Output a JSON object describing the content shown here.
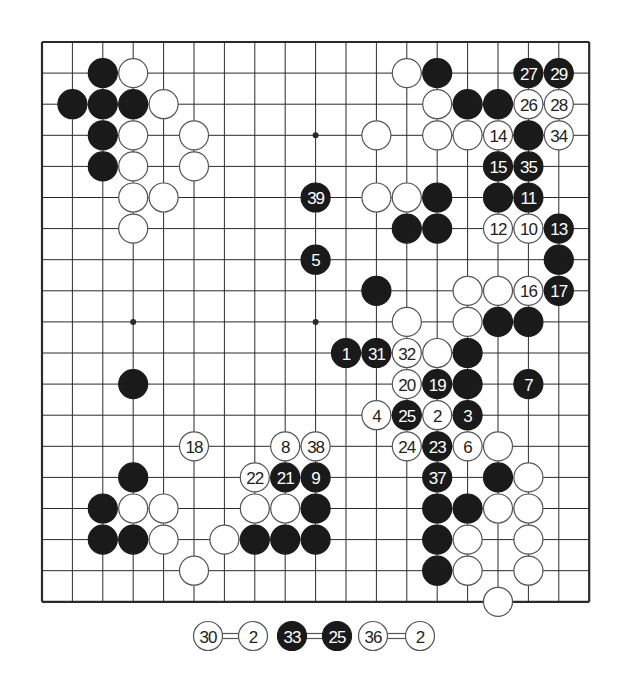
{
  "diagram": {
    "type": "go-board",
    "size": 19,
    "star_points": [
      [
        3,
        3
      ],
      [
        9,
        3
      ],
      [
        15,
        3
      ],
      [
        3,
        9
      ],
      [
        9,
        9
      ],
      [
        15,
        9
      ],
      [
        3,
        15
      ],
      [
        9,
        15
      ],
      [
        15,
        15
      ]
    ],
    "colors": {
      "black": "#1a1a1a",
      "white": "#ffffff",
      "line": "#2a2a2a",
      "stone_outline": "#555555"
    },
    "stones": [
      {
        "c": 2,
        "r": 1,
        "color": "black"
      },
      {
        "c": 1,
        "r": 2,
        "color": "black"
      },
      {
        "c": 2,
        "r": 2,
        "color": "black"
      },
      {
        "c": 3,
        "r": 2,
        "color": "black"
      },
      {
        "c": 2,
        "r": 3,
        "color": "black"
      },
      {
        "c": 2,
        "r": 4,
        "color": "black"
      },
      {
        "c": 13,
        "r": 1,
        "color": "black"
      },
      {
        "c": 16,
        "r": 1,
        "color": "black",
        "label": "27"
      },
      {
        "c": 17,
        "r": 1,
        "color": "black",
        "label": "29"
      },
      {
        "c": 14,
        "r": 2,
        "color": "black"
      },
      {
        "c": 15,
        "r": 2,
        "color": "black"
      },
      {
        "c": 16,
        "r": 3,
        "color": "black"
      },
      {
        "c": 15,
        "r": 4,
        "color": "black",
        "label": "15"
      },
      {
        "c": 16,
        "r": 4,
        "color": "black",
        "label": "35"
      },
      {
        "c": 9,
        "r": 5,
        "color": "black",
        "label": "39"
      },
      {
        "c": 13,
        "r": 5,
        "color": "black"
      },
      {
        "c": 15,
        "r": 5,
        "color": "black"
      },
      {
        "c": 16,
        "r": 5,
        "color": "black",
        "label": "11"
      },
      {
        "c": 12,
        "r": 6,
        "color": "black"
      },
      {
        "c": 13,
        "r": 6,
        "color": "black"
      },
      {
        "c": 17,
        "r": 6,
        "color": "black",
        "label": "13"
      },
      {
        "c": 9,
        "r": 7,
        "color": "black",
        "label": "5"
      },
      {
        "c": 17,
        "r": 7,
        "color": "black"
      },
      {
        "c": 11,
        "r": 8,
        "color": "black"
      },
      {
        "c": 17,
        "r": 8,
        "color": "black",
        "label": "17"
      },
      {
        "c": 15,
        "r": 9,
        "color": "black"
      },
      {
        "c": 16,
        "r": 9,
        "color": "black"
      },
      {
        "c": 10,
        "r": 10,
        "color": "black",
        "label": "1"
      },
      {
        "c": 11,
        "r": 10,
        "color": "black",
        "label": "31"
      },
      {
        "c": 14,
        "r": 10,
        "color": "black"
      },
      {
        "c": 3,
        "r": 11,
        "color": "black"
      },
      {
        "c": 13,
        "r": 11,
        "color": "black",
        "label": "19"
      },
      {
        "c": 14,
        "r": 11,
        "color": "black"
      },
      {
        "c": 16,
        "r": 11,
        "color": "black",
        "label": "7"
      },
      {
        "c": 12,
        "r": 12,
        "color": "black",
        "label": "25"
      },
      {
        "c": 14,
        "r": 12,
        "color": "black",
        "label": "3"
      },
      {
        "c": 13,
        "r": 13,
        "color": "black",
        "label": "23"
      },
      {
        "c": 3,
        "r": 14,
        "color": "black"
      },
      {
        "c": 8,
        "r": 14,
        "color": "black",
        "label": "21"
      },
      {
        "c": 9,
        "r": 14,
        "color": "black",
        "label": "9"
      },
      {
        "c": 13,
        "r": 14,
        "color": "black",
        "label": "37"
      },
      {
        "c": 15,
        "r": 14,
        "color": "black"
      },
      {
        "c": 2,
        "r": 15,
        "color": "black"
      },
      {
        "c": 9,
        "r": 15,
        "color": "black"
      },
      {
        "c": 13,
        "r": 15,
        "color": "black"
      },
      {
        "c": 14,
        "r": 15,
        "color": "black"
      },
      {
        "c": 2,
        "r": 16,
        "color": "black"
      },
      {
        "c": 3,
        "r": 16,
        "color": "black"
      },
      {
        "c": 7,
        "r": 16,
        "color": "black"
      },
      {
        "c": 8,
        "r": 16,
        "color": "black"
      },
      {
        "c": 9,
        "r": 16,
        "color": "black"
      },
      {
        "c": 13,
        "r": 16,
        "color": "black"
      },
      {
        "c": 13,
        "r": 17,
        "color": "black"
      },
      {
        "c": 3,
        "r": 1,
        "color": "white"
      },
      {
        "c": 12,
        "r": 1,
        "color": "white"
      },
      {
        "c": 4,
        "r": 2,
        "color": "white"
      },
      {
        "c": 13,
        "r": 2,
        "color": "white"
      },
      {
        "c": 16,
        "r": 2,
        "color": "white",
        "label": "26"
      },
      {
        "c": 17,
        "r": 2,
        "color": "white",
        "label": "28"
      },
      {
        "c": 3,
        "r": 3,
        "color": "white"
      },
      {
        "c": 5,
        "r": 3,
        "color": "white"
      },
      {
        "c": 11,
        "r": 3,
        "color": "white"
      },
      {
        "c": 13,
        "r": 3,
        "color": "white"
      },
      {
        "c": 14,
        "r": 3,
        "color": "white"
      },
      {
        "c": 15,
        "r": 3,
        "color": "white",
        "label": "14"
      },
      {
        "c": 17,
        "r": 3,
        "color": "white",
        "label": "34"
      },
      {
        "c": 3,
        "r": 4,
        "color": "white"
      },
      {
        "c": 5,
        "r": 4,
        "color": "white"
      },
      {
        "c": 3,
        "r": 5,
        "color": "white"
      },
      {
        "c": 4,
        "r": 5,
        "color": "white"
      },
      {
        "c": 11,
        "r": 5,
        "color": "white"
      },
      {
        "c": 12,
        "r": 5,
        "color": "white"
      },
      {
        "c": 3,
        "r": 6,
        "color": "white"
      },
      {
        "c": 15,
        "r": 6,
        "color": "white",
        "label": "12"
      },
      {
        "c": 16,
        "r": 6,
        "color": "white",
        "label": "10"
      },
      {
        "c": 14,
        "r": 8,
        "color": "white"
      },
      {
        "c": 15,
        "r": 8,
        "color": "white"
      },
      {
        "c": 16,
        "r": 8,
        "color": "white",
        "label": "16"
      },
      {
        "c": 12,
        "r": 9,
        "color": "white"
      },
      {
        "c": 14,
        "r": 9,
        "color": "white"
      },
      {
        "c": 12,
        "r": 10,
        "color": "white",
        "label": "32"
      },
      {
        "c": 13,
        "r": 10,
        "color": "white"
      },
      {
        "c": 12,
        "r": 11,
        "color": "white",
        "label": "20"
      },
      {
        "c": 11,
        "r": 12,
        "color": "white",
        "label": "4"
      },
      {
        "c": 13,
        "r": 12,
        "color": "white",
        "label": "2"
      },
      {
        "c": 5,
        "r": 13,
        "color": "white",
        "label": "18"
      },
      {
        "c": 8,
        "r": 13,
        "color": "white",
        "label": "8"
      },
      {
        "c": 9,
        "r": 13,
        "color": "white",
        "label": "38"
      },
      {
        "c": 12,
        "r": 13,
        "color": "white",
        "label": "24"
      },
      {
        "c": 14,
        "r": 13,
        "color": "white",
        "label": "6"
      },
      {
        "c": 15,
        "r": 13,
        "color": "white"
      },
      {
        "c": 7,
        "r": 14,
        "color": "white",
        "label": "22"
      },
      {
        "c": 16,
        "r": 14,
        "color": "white"
      },
      {
        "c": 3,
        "r": 15,
        "color": "white"
      },
      {
        "c": 4,
        "r": 15,
        "color": "white"
      },
      {
        "c": 7,
        "r": 15,
        "color": "white"
      },
      {
        "c": 8,
        "r": 15,
        "color": "white"
      },
      {
        "c": 15,
        "r": 15,
        "color": "white"
      },
      {
        "c": 16,
        "r": 15,
        "color": "white"
      },
      {
        "c": 4,
        "r": 16,
        "color": "white"
      },
      {
        "c": 6,
        "r": 16,
        "color": "white"
      },
      {
        "c": 14,
        "r": 16,
        "color": "white"
      },
      {
        "c": 16,
        "r": 16,
        "color": "white"
      },
      {
        "c": 5,
        "r": 17,
        "color": "white"
      },
      {
        "c": 14,
        "r": 17,
        "color": "white"
      },
      {
        "c": 16,
        "r": 17,
        "color": "white"
      },
      {
        "c": 15,
        "r": 18,
        "color": "white"
      }
    ],
    "caption": [
      {
        "left": {
          "color": "white",
          "label": "30"
        },
        "right": {
          "color": "white",
          "label": "2"
        }
      },
      {
        "left": {
          "color": "black",
          "label": "33"
        },
        "right": {
          "color": "black",
          "label": "25"
        }
      },
      {
        "left": {
          "color": "white",
          "label": "36"
        },
        "right": {
          "color": "white",
          "label": "2"
        }
      }
    ]
  }
}
